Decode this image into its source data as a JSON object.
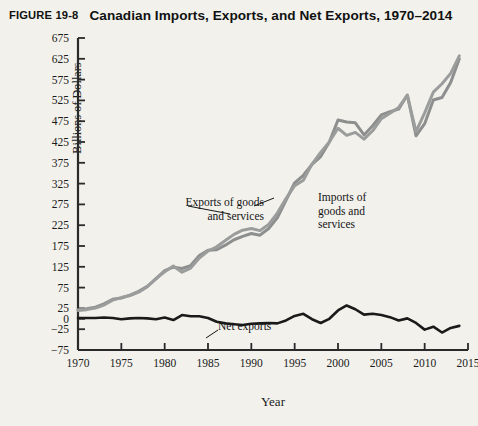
{
  "header": {
    "figure_number": "FIGURE 19-8",
    "title": "Canadian Imports, Exports, and Net Exports, 1970–2014"
  },
  "axes": {
    "y_title": "Billions of Dollars",
    "x_title": "Year",
    "y_ticks": [
      675,
      625,
      575,
      525,
      475,
      425,
      375,
      325,
      275,
      225,
      175,
      125,
      75,
      25,
      0,
      -25,
      -75
    ],
    "y_min": -75,
    "y_max": 675,
    "x_ticks": [
      1970,
      1975,
      1980,
      1985,
      1990,
      1995,
      2000,
      2005,
      2010,
      2015
    ],
    "x_min": 1970,
    "x_max": 2015
  },
  "annotations": {
    "exports": "Exports of goods\nand services",
    "imports": "Imports of\ngoods and\nservices",
    "net_exports": "Net exports"
  },
  "colors": {
    "background": "#f2f1ec",
    "exports_line": "#8d8f8e",
    "imports_line": "#9b9d9c",
    "net_line": "#1a1a1a",
    "axis": "#2a2a2a"
  },
  "chart_data": {
    "type": "line",
    "title": "Canadian Imports, Exports, and Net Exports, 1970–2014",
    "xlabel": "Year",
    "ylabel": "Billions of Dollars",
    "xlim": [
      1970,
      2015
    ],
    "ylim": [
      -75,
      675
    ],
    "grid": false,
    "legend": "annotations-inline",
    "x": [
      1970,
      1971,
      1972,
      1973,
      1974,
      1975,
      1976,
      1977,
      1978,
      1979,
      1980,
      1981,
      1982,
      1983,
      1984,
      1985,
      1986,
      1987,
      1988,
      1989,
      1990,
      1991,
      1992,
      1993,
      1994,
      1995,
      1996,
      1997,
      1998,
      1999,
      2000,
      2001,
      2002,
      2003,
      2004,
      2005,
      2006,
      2007,
      2008,
      2009,
      2010,
      2011,
      2012,
      2013,
      2014
    ],
    "series": [
      {
        "name": "Exports of goods and services",
        "color": "#8d8f8e",
        "values": [
          22,
          24,
          28,
          36,
          47,
          50,
          57,
          66,
          78,
          96,
          116,
          124,
          121,
          128,
          152,
          165,
          166,
          177,
          190,
          198,
          205,
          201,
          217,
          243,
          285,
          327,
          345,
          371,
          390,
          425,
          478,
          473,
          471,
          442,
          464,
          490,
          498,
          504,
          538,
          440,
          469,
          526,
          532,
          568,
          625
        ]
      },
      {
        "name": "Imports of goods and services",
        "color": "#9b9d9c",
        "values": [
          20,
          22,
          26,
          33,
          45,
          51,
          56,
          64,
          77,
          97,
          113,
          127,
          112,
          122,
          146,
          163,
          173,
          188,
          203,
          213,
          217,
          212,
          227,
          254,
          289,
          320,
          333,
          372,
          400,
          425,
          458,
          441,
          448,
          432,
          452,
          481,
          494,
          508,
          537,
          450,
          495,
          545,
          565,
          590,
          632
        ]
      },
      {
        "name": "Net exports",
        "color": "#1a1a1a",
        "values": [
          2,
          2,
          2,
          3,
          2,
          -1,
          1,
          2,
          1,
          -1,
          3,
          -3,
          9,
          6,
          6,
          2,
          -7,
          -11,
          -13,
          -15,
          -12,
          -11,
          -10,
          -11,
          -4,
          7,
          12,
          -1,
          -10,
          0,
          20,
          32,
          23,
          10,
          12,
          9,
          4,
          -4,
          1,
          -10,
          -26,
          -19,
          -33,
          -22,
          -17
        ]
      }
    ]
  }
}
